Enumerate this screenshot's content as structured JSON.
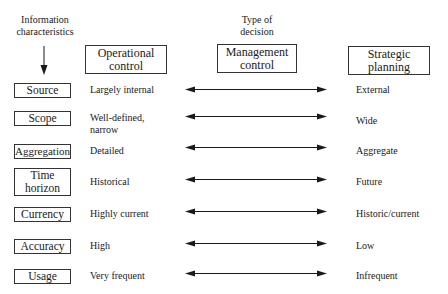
{
  "header": {
    "info_label_line1": "Information",
    "info_label_line2": "characteristics",
    "type_label_line1": "Type of",
    "type_label_line2": "decision"
  },
  "columns": [
    {
      "line1": "Operational",
      "line2": "control"
    },
    {
      "line1": "Management",
      "line2": "control"
    },
    {
      "line1": "Strategic",
      "line2": "planning"
    }
  ],
  "rows": [
    {
      "label_line1": "Source",
      "label_line2": "",
      "operational_line1": "Largely internal",
      "operational_line2": "",
      "strategic": "External"
    },
    {
      "label_line1": "Scope",
      "label_line2": "",
      "operational_line1": "Well-defined,",
      "operational_line2": "narrow",
      "strategic": "Wide"
    },
    {
      "label_line1": "Aggregation",
      "label_line2": "",
      "operational_line1": "Detailed",
      "operational_line2": "",
      "strategic": "Aggregate"
    },
    {
      "label_line1": "Time",
      "label_line2": "horizon",
      "operational_line1": "Historical",
      "operational_line2": "",
      "strategic": "Future"
    },
    {
      "label_line1": "Currency",
      "label_line2": "",
      "operational_line1": "Highly current",
      "operational_line2": "",
      "strategic": "Historic/current"
    },
    {
      "label_line1": "Accuracy",
      "label_line2": "",
      "operational_line1": "High",
      "operational_line2": "",
      "strategic": "Low"
    },
    {
      "label_line1": "Usage",
      "label_line2": "",
      "operational_line1": "Very frequent",
      "operational_line2": "",
      "strategic": "Infrequent"
    }
  ],
  "icons": {
    "down_arrow": "arrow-down-icon",
    "row_arrow": "double-headed-arrow-icon"
  },
  "colors": {
    "line": "#1a1a1a",
    "box_border": "#333333",
    "background": "#ffffff"
  }
}
